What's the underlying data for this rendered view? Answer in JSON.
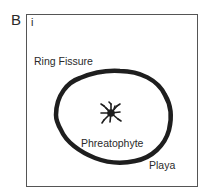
{
  "panel": {
    "letter": "B",
    "sublabel": "i"
  },
  "labels": {
    "ring_fissure": "Ring Fissure",
    "phreatophyte": "Phreatophyte",
    "playa": "Playa"
  },
  "colors": {
    "ink": "#2a2a2a",
    "frame": "#555555",
    "background": "#ffffff"
  }
}
